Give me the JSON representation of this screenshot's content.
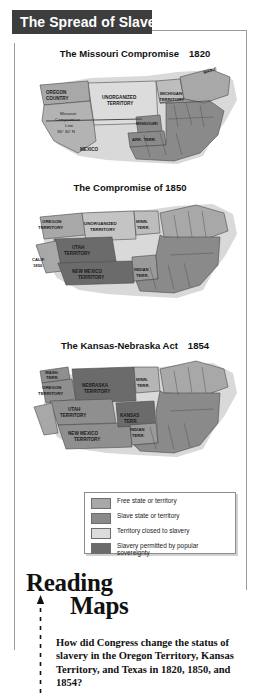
{
  "header": {
    "title": "The Spread of Slavery"
  },
  "maps": [
    {
      "id": "missouri-compromise",
      "title": "The Missouri Compromise",
      "year": "1820",
      "labels": [
        {
          "text": "OREGON COUNTRY",
          "x": 30,
          "y": 36
        },
        {
          "text": "UNORGANIZED TERRITORY",
          "x": 96,
          "y": 42
        },
        {
          "text": "MICHIGAN TERRITORY",
          "x": 146,
          "y": 38
        },
        {
          "text": "MAINE",
          "x": 193,
          "y": 16
        },
        {
          "text": "Missouri Compromise Line 36° 30' N",
          "x": 44,
          "y": 64
        },
        {
          "text": "MISSOURI",
          "x": 116,
          "y": 68
        },
        {
          "text": "ARK. TERR.",
          "x": 120,
          "y": 82
        },
        {
          "text": "MEXICO",
          "x": 70,
          "y": 92
        }
      ]
    },
    {
      "id": "compromise-1850",
      "title": "The Compromise of 1850",
      "year": "",
      "labels": [
        {
          "text": "OREGON TERRITORY",
          "x": 26,
          "y": 30
        },
        {
          "text": "UNORGANIZED TERRITORY",
          "x": 72,
          "y": 33
        },
        {
          "text": "MINN. TERR.",
          "x": 122,
          "y": 29
        },
        {
          "text": "UTAH TERRITORY",
          "x": 44,
          "y": 53
        },
        {
          "text": "CALIF. 1850",
          "x": 12,
          "y": 70
        },
        {
          "text": "NEW MEXICO TERRITORY",
          "x": 56,
          "y": 74
        },
        {
          "text": "INDIAN TERR.",
          "x": 120,
          "y": 74
        }
      ]
    },
    {
      "id": "kansas-nebraska-act",
      "title": "The Kansas-Nebraska Act",
      "year": "1854",
      "labels": [
        {
          "text": "WASH. TERR.",
          "x": 24,
          "y": 18
        },
        {
          "text": "OREGON TERRITORY",
          "x": 20,
          "y": 34
        },
        {
          "text": "NEBRASKA TERRITORY",
          "x": 68,
          "y": 36
        },
        {
          "text": "MINN. TERR.",
          "x": 122,
          "y": 31
        },
        {
          "text": "UTAH TERRITORY",
          "x": 38,
          "y": 58
        },
        {
          "text": "KANSAS TERR.",
          "x": 100,
          "y": 64
        },
        {
          "text": "NEW MEXICO TERRITORY",
          "x": 50,
          "y": 78
        },
        {
          "text": "INDIAN TERR.",
          "x": 118,
          "y": 76
        }
      ]
    }
  ],
  "legend": {
    "items": [
      {
        "label": "Free state or territory",
        "color": "#a8a8a8"
      },
      {
        "label": "Slave state or territory",
        "color": "#8a8a8a"
      },
      {
        "label": "Territory closed to slavery",
        "color": "#dcdcdc"
      },
      {
        "label": "Slavery permitted by popular sovereignty",
        "color": "#6b6b6b"
      }
    ]
  },
  "reading_maps": {
    "heading_line1": "Reading",
    "heading_line2": "Maps",
    "question": "How did Congress change the status of slavery in the Oregon Territory, Kansas Territory, and Texas in 1820, 1850, and 1854?"
  },
  "colors": {
    "banner_bg": "#3d3d3d",
    "banner_text": "#ffffff",
    "free": "#a8a8a8",
    "slave": "#8a8a8a",
    "closed": "#dcdcdc",
    "popular_sovereignty": "#6b6b6b",
    "outline": "#4a4a4a",
    "rule": "#9a9a9a"
  }
}
